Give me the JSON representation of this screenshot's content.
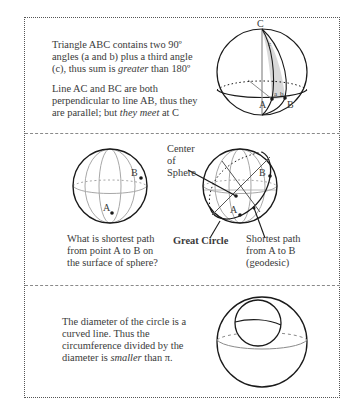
{
  "section1": {
    "paragraph1": {
      "line1": "Triangle ABC contains two 90º",
      "line2": "angles (a and b)  plus a third angle",
      "line3_pre": "(c), thus sum is ",
      "line3_em": "greater",
      "line3_post": " than 180º"
    },
    "paragraph2": {
      "line1": "Line AC and BC are both",
      "line2": "perpendicular to line AB, thus they",
      "line3_pre": "are parallel; but ",
      "line3_em": "they meet",
      "line3_post": " at C"
    },
    "figure_labels": {
      "C": "C",
      "c": "c",
      "a": "a",
      "b": "b",
      "A": "A",
      "B": "B"
    }
  },
  "section2": {
    "left_figure_labels": {
      "A": "A",
      "B": "B"
    },
    "right_figure_labels": {
      "A": "A",
      "B": "B"
    },
    "center_label": [
      "Center",
      "of",
      "Sphere"
    ],
    "question": [
      "What is shortest path",
      "from point A to B on",
      "the surface of sphere?"
    ],
    "great_circle_label": "Great Circle",
    "geodesic_label": [
      "Shortest path",
      "from A to B",
      "(geodesic)"
    ]
  },
  "section3": {
    "text": {
      "line1": "The diameter of the circle is a",
      "line2": "curved line. Thus the",
      "line3": "circumference divided by the",
      "line4_pre": "diameter is ",
      "line4_em": "smaller",
      "line4_post": " than π."
    }
  },
  "colors": {
    "ink": "#1a1a1a",
    "text": "#3a3a3a",
    "grid": "#a8a8a8",
    "shade": "#d9d9d9",
    "border": "#555555"
  }
}
